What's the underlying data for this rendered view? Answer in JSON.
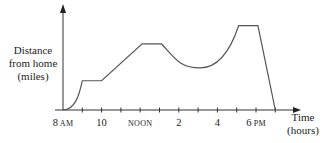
{
  "chart_data": {
    "type": "line",
    "title": "",
    "xlabel": "Time (hours)",
    "ylabel": "Distance from home (miles)",
    "x_tick_labels": [
      {
        "hour": 8,
        "label": "8",
        "suffix": "AM"
      },
      {
        "hour": 10,
        "label": "10",
        "suffix": ""
      },
      {
        "hour": 12,
        "label": "",
        "suffix": "NOON"
      },
      {
        "hour": 14,
        "label": "2",
        "suffix": ""
      },
      {
        "hour": 16,
        "label": "4",
        "suffix": ""
      },
      {
        "hour": 18,
        "label": "6",
        "suffix": "PM"
      }
    ],
    "x_ticks_hours": [
      8,
      9,
      10,
      11,
      12,
      13,
      14,
      15,
      16,
      17,
      18,
      19
    ],
    "xlim": [
      8,
      19.5
    ],
    "ylim": [
      0,
      1
    ],
    "grid": false,
    "y_tick_labels": [],
    "note": "Distance values are qualitative (no y-axis numbers); normalized 0-1",
    "series": [
      {
        "name": "Distance from home",
        "points": [
          {
            "x": 8.0,
            "y": 0.0
          },
          {
            "x": 9.0,
            "y": 0.34
          },
          {
            "x": 10.0,
            "y": 0.34
          },
          {
            "x": 12.1,
            "y": 0.77
          },
          {
            "x": 13.1,
            "y": 0.77
          },
          {
            "x": 15.1,
            "y": 0.49
          },
          {
            "x": 17.1,
            "y": 0.98
          },
          {
            "x": 18.1,
            "y": 0.98
          },
          {
            "x": 19.0,
            "y": 0.0
          }
        ]
      }
    ]
  },
  "labels": {
    "y_axis": [
      "Distance",
      "from home",
      "(miles)"
    ],
    "x_axis": [
      "Time",
      "(hours)"
    ]
  }
}
